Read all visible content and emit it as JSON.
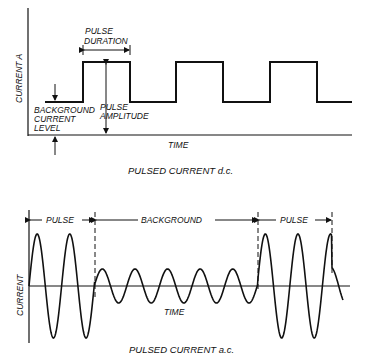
{
  "dc": {
    "y_label": "CURRENT A",
    "x_label": "TIME",
    "caption": "PULSED CURRENT d.c.",
    "pulse_duration_label_1": "PULSE",
    "pulse_duration_label_2": "DURATION",
    "pulse_amplitude_label_1": "PULSE",
    "pulse_amplitude_label_2": "AMPLITUDE",
    "background_label_1": "BACKGROUND",
    "background_label_2": "CURRENT",
    "background_label_3": "LEVEL",
    "pulses": [
      [
        83,
        130
      ],
      [
        176,
        223
      ],
      [
        270,
        317
      ]
    ],
    "start_x": 45,
    "end_x": 352,
    "high_y": 62,
    "low_y": 102,
    "axis_y": 135,
    "axis_x": 28
  },
  "ac": {
    "y_label": "CURRENT",
    "x_label": "TIME",
    "caption": "PULSED CURRENT a.c.",
    "segments": [
      "PULSE",
      "BACKGROUND",
      "PULSE"
    ],
    "boundaries": [
      29,
      95,
      258,
      332
    ],
    "zero_y": 286,
    "pulse_amplitude": 52,
    "background_amplitude": 17,
    "period": 32.6
  },
  "colors": {
    "ink": "#111111",
    "background": "#ffffff"
  }
}
